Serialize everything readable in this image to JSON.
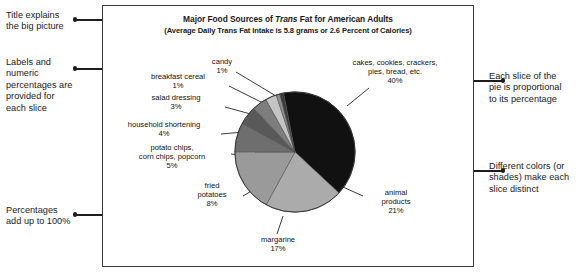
{
  "chart_data": {
    "type": "pie",
    "title": "Major Food Sources of Trans Fat for American Adults",
    "subtitle": "(Average Daily Trans Fat Intake is 5.8 grams or 2.6 Percent of Calories)",
    "title_parts": {
      "t1": "Major Food Sources of ",
      "t_italic": "Trans",
      "t2": " Fat for American Adults",
      "s1": "(Average Daily ",
      "s_italic": "Trans",
      "s2": " Fat Intake is 5.8 grams or 2.6 Percent of Calories)"
    },
    "unit": "percent",
    "total": "100%",
    "legend": "none",
    "grid": false,
    "categories": [
      "cakes, cookies, crackers, pies, bread, etc.",
      "animal products",
      "margarine",
      "fried potatoes",
      "potato chips, corn chips, popcorn",
      "household shortening",
      "salad dressing",
      "breakfast cereal",
      "candy"
    ],
    "values": [
      40,
      21,
      17,
      8,
      5,
      4,
      3,
      1,
      1
    ],
    "slices": [
      {
        "label": "cakes, cookies, crackers,\npies, bread, etc.",
        "label_line1": "cakes, cookies, crackers,",
        "label_line2": "pies, bread, etc.",
        "percent": "40%",
        "value": 40,
        "color": "#111111"
      },
      {
        "label": "animal products",
        "label_line1": "animal",
        "label_line2": "products",
        "percent": "21%",
        "value": 21,
        "color": "#ababab"
      },
      {
        "label": "margarine",
        "label_line1": "margarine",
        "label_line2": "",
        "percent": "17%",
        "value": 17,
        "color": "#9a9a9a"
      },
      {
        "label": "fried potatoes",
        "label_line1": "fried",
        "label_line2": "potatoes",
        "percent": "8%",
        "value": 8,
        "color": "#6e6e6e"
      },
      {
        "label": "potato chips, corn chips, popcorn",
        "label_line1": "potato chips,",
        "label_line2": "corn chips, popcorn",
        "percent": "5%",
        "value": 5,
        "color": "#595959"
      },
      {
        "label": "household shortening",
        "label_line1": "household shortening",
        "label_line2": "",
        "percent": "4%",
        "value": 4,
        "color": "#7d7d7d"
      },
      {
        "label": "salad dressing",
        "label_line1": "salad dressing",
        "label_line2": "",
        "percent": "3%",
        "value": 3,
        "color": "#c4c4c4"
      },
      {
        "label": "breakfast cereal",
        "label_line1": "breakfast cereal",
        "label_line2": "",
        "percent": "1%",
        "value": 1,
        "color": "#8d8d8d"
      },
      {
        "label": "candy",
        "label_line1": "candy",
        "label_line2": "",
        "percent": "1%",
        "value": 1,
        "color": "#3b3b3b"
      }
    ]
  },
  "annotations": {
    "title_note_line1": "Title explains",
    "title_note_line2": "the big picture",
    "labels_note_line1": "Labels and",
    "labels_note_line2": "numeric",
    "labels_note_line3": "percentages are",
    "labels_note_line4": "provided for",
    "labels_note_line5": "each slice",
    "percent_note_line1": "Percentages",
    "percent_note_line2": "add up to 100%",
    "proportional_note_line1": "Each slice of the",
    "proportional_note_line2": "pie is proportional",
    "proportional_note_line3": "to its percentage",
    "colors_note_line1": "Different colors (or",
    "colors_note_line2": "shades) make each",
    "colors_note_line3": "slice distinct"
  }
}
